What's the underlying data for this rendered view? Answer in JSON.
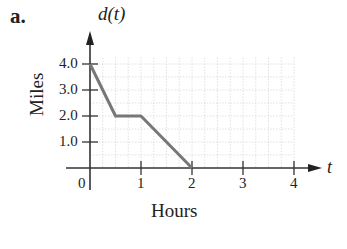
{
  "part_label": "a.",
  "chart_data": {
    "type": "line",
    "title": "d(t)",
    "xlabel": "Hours",
    "ylabel": "Miles",
    "x_axis_var": "t",
    "x": [
      0,
      0.5,
      1,
      2
    ],
    "series": [
      {
        "name": "d(t)",
        "values": [
          4.0,
          2.0,
          2.0,
          0.0
        ]
      }
    ],
    "x_ticks": [
      "0",
      "1",
      "2",
      "3",
      "4"
    ],
    "y_ticks": [
      "1.0",
      "2.0",
      "3.0",
      "4.0"
    ],
    "xlim": [
      0,
      4
    ],
    "ylim": [
      0,
      4.5
    ],
    "grid": true,
    "line_color": "#777777"
  }
}
